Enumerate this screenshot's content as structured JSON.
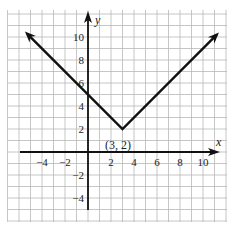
{
  "chart_data": {
    "type": "line",
    "title": "",
    "xlabel": "x",
    "ylabel": "y",
    "xlim": [
      -7,
      12
    ],
    "ylim": [
      -6,
      12
    ],
    "grid": true,
    "x_ticks": [
      {
        "value": -4,
        "label": "−4"
      },
      {
        "value": -2,
        "label": "−2"
      },
      {
        "value": 2,
        "label": "2"
      },
      {
        "value": 4,
        "label": "4"
      },
      {
        "value": 6,
        "label": "6"
      },
      {
        "value": 8,
        "label": "8"
      },
      {
        "value": 10,
        "label": "10"
      }
    ],
    "y_ticks": [
      {
        "value": 10,
        "label": "10"
      },
      {
        "value": 8,
        "label": "8"
      },
      {
        "value": 6,
        "label": "6"
      },
      {
        "value": 4,
        "label": "4"
      },
      {
        "value": 2,
        "label": "2"
      },
      {
        "value": -2,
        "label": "−2"
      },
      {
        "value": -4,
        "label": "−4"
      }
    ],
    "series": [
      {
        "name": "y = |x - 3| + 2",
        "x": [
          -5.3,
          3,
          11.2
        ],
        "y": [
          10.3,
          2,
          10.2
        ],
        "arrows_both_ends": true
      }
    ],
    "annotations": [
      {
        "x": 3,
        "y": 2,
        "text": "(3, 2)"
      }
    ]
  },
  "labels": {
    "x_axis": "x",
    "y_axis": "y",
    "vertex": "(3, 2)"
  }
}
